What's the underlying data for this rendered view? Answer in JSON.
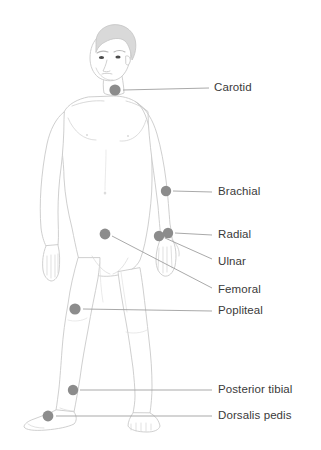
{
  "diagram": {
    "title_partial_cropped": "",
    "colors": {
      "background": "#ffffff",
      "body_outline": "#c9c9c9",
      "body_fill": "#ffffff",
      "hair_fill": "#d9d9d9",
      "hair_outline": "#c4c4c4",
      "pulse_dot": "#8c8c8c",
      "leader_line": "#9a9a9a",
      "label_text": "#3a3a3a",
      "eye": "#4a4a4a"
    },
    "pulse_points": [
      {
        "label": "Carotid",
        "dot_x": 115,
        "dot_y": 90,
        "label_x": 214,
        "label_y": 88,
        "line_x1": 123,
        "line_y1": 90,
        "line_x2": 209,
        "line_y2": 88
      },
      {
        "label": "Brachial",
        "dot_x": 166,
        "dot_y": 191,
        "label_x": 218,
        "label_y": 192,
        "line_x1": 173,
        "line_y1": 191,
        "line_x2": 212,
        "line_y2": 192
      },
      {
        "label": "Radial",
        "dot_x": 168,
        "dot_y": 233,
        "label_x": 218,
        "label_y": 235,
        "line_x1": 175,
        "line_y1": 233,
        "line_x2": 212,
        "line_y2": 235
      },
      {
        "label": "Ulnar",
        "dot_x": 159,
        "dot_y": 236,
        "label_x": 218,
        "label_y": 262,
        "line_x1": 165,
        "line_y1": 238,
        "line_x2": 212,
        "line_y2": 259
      },
      {
        "label": "Femoral",
        "dot_x": 105,
        "dot_y": 234,
        "label_x": 218,
        "label_y": 290,
        "line_x1": 112,
        "line_y1": 236,
        "line_x2": 212,
        "line_y2": 288
      },
      {
        "label": "Popliteal",
        "dot_x": 75,
        "dot_y": 309,
        "label_x": 218,
        "label_y": 311,
        "line_x1": 83,
        "line_y1": 309,
        "line_x2": 212,
        "line_y2": 311
      },
      {
        "label": "Posterior tibial",
        "dot_x": 73,
        "dot_y": 390,
        "label_x": 218,
        "label_y": 390,
        "line_x1": 80,
        "line_y1": 390,
        "line_x2": 212,
        "line_y2": 390
      },
      {
        "label": "Dorsalis pedis",
        "dot_x": 48,
        "dot_y": 416,
        "label_x": 218,
        "label_y": 416,
        "line_x1": 56,
        "line_y1": 416,
        "line_x2": 212,
        "line_y2": 416
      }
    ]
  }
}
